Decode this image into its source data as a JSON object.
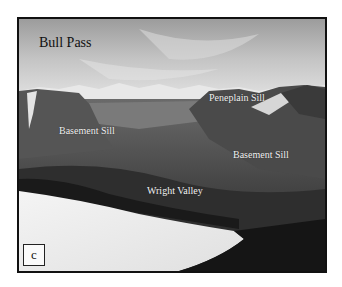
{
  "figure": {
    "panel_letter": "c",
    "title": "Bull Pass",
    "labels": [
      {
        "text": "Peneplain Sill"
      },
      {
        "text": "Basement  Sill"
      },
      {
        "text": "Basement  Sill"
      },
      {
        "text": "Wright Valley"
      }
    ],
    "colors": {
      "frame_border": "#111111",
      "label_text": "#f2f2f2",
      "title_text": "#111111"
    }
  }
}
